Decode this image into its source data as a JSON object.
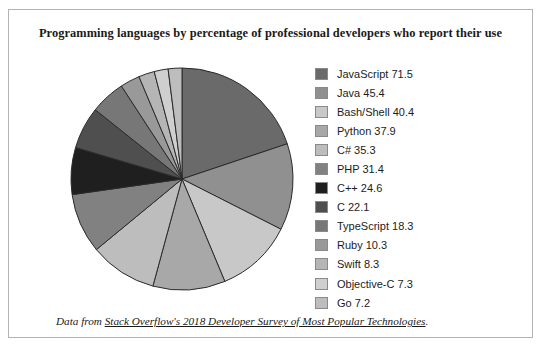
{
  "chart_data": {
    "type": "pie",
    "title": "Programming languages by percentage of professional developers who report their use",
    "xlabel": "",
    "ylabel": "",
    "legend_position": "right",
    "grid": false,
    "start_angle_deg": 0,
    "direction": "clockwise",
    "value_unit": "percent",
    "categories": [
      "JavaScript",
      "Java",
      "Bash/Shell",
      "Python",
      "C#",
      "PHP",
      "C++",
      "C",
      "TypeScript",
      "Ruby",
      "Swift",
      "Objective-C",
      "Go"
    ],
    "values": [
      71.5,
      45.4,
      40.4,
      37.9,
      35.3,
      31.4,
      24.6,
      22.1,
      18.3,
      10.3,
      8.3,
      7.3,
      7.2
    ],
    "colors": [
      "#6a6a6a",
      "#909090",
      "#c8c8c8",
      "#a8a8a8",
      "#bdbdbd",
      "#818181",
      "#1f1f1f",
      "#4f4f4f",
      "#777777",
      "#999999",
      "#b5b5b5",
      "#cfcfcf",
      "#bdbdbd"
    ],
    "slices": [
      {
        "label": "JavaScript",
        "value": 71.5,
        "color": "#6a6a6a"
      },
      {
        "label": "Java",
        "value": 45.4,
        "color": "#909090"
      },
      {
        "label": "Bash/Shell",
        "value": 40.4,
        "color": "#c8c8c8"
      },
      {
        "label": "Python",
        "value": 37.9,
        "color": "#a8a8a8"
      },
      {
        "label": "C#",
        "value": 35.3,
        "color": "#bdbdbd"
      },
      {
        "label": "PHP",
        "value": 31.4,
        "color": "#818181"
      },
      {
        "label": "C++",
        "value": 24.6,
        "color": "#1f1f1f"
      },
      {
        "label": "C",
        "value": 22.1,
        "color": "#4f4f4f"
      },
      {
        "label": "TypeScript",
        "value": 18.3,
        "color": "#777777"
      },
      {
        "label": "Ruby",
        "value": 10.3,
        "color": "#999999"
      },
      {
        "label": "Swift",
        "value": 8.3,
        "color": "#b5b5b5"
      },
      {
        "label": "Objective-C",
        "value": 7.3,
        "color": "#cfcfcf"
      },
      {
        "label": "Go",
        "value": 7.2,
        "color": "#bdbdbd"
      }
    ]
  },
  "legend": {
    "items": [
      {
        "label": "JavaScript 71.5",
        "color": "#6a6a6a"
      },
      {
        "label": "Java 45.4",
        "color": "#909090"
      },
      {
        "label": "Bash/Shell 40.4",
        "color": "#c8c8c8"
      },
      {
        "label": "Python 37.9",
        "color": "#a8a8a8"
      },
      {
        "label": "C# 35.3",
        "color": "#bdbdbd"
      },
      {
        "label": "PHP 31.4",
        "color": "#818181"
      },
      {
        "label": "C++ 24.6",
        "color": "#1f1f1f"
      },
      {
        "label": "C 22.1",
        "color": "#4f4f4f"
      },
      {
        "label": "TypeScript 18.3",
        "color": "#777777"
      },
      {
        "label": "Ruby 10.3",
        "color": "#999999"
      },
      {
        "label": "Swift 8.3",
        "color": "#b5b5b5"
      },
      {
        "label": "Objective-C 7.3",
        "color": "#cfcfcf"
      },
      {
        "label": "Go 7.2",
        "color": "#bdbdbd"
      }
    ]
  },
  "footnote": {
    "prefix": "Data from ",
    "link_text": "Stack Overflow's 2018 Developer Survey of Most Popular Technologies",
    "suffix": "."
  },
  "style": {
    "border_color": "#b2b2b2",
    "slice_outline": "#2b2b2b",
    "background": "#ffffff"
  }
}
